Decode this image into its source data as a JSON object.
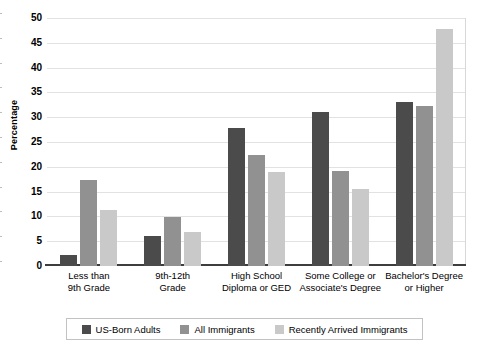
{
  "chart_data": {
    "type": "bar",
    "title": "",
    "xlabel": "",
    "ylabel": "Percentage",
    "ylim": [
      0,
      50
    ],
    "yticks": [
      0,
      5,
      10,
      15,
      20,
      25,
      30,
      35,
      40,
      45,
      50
    ],
    "grid": true,
    "legend_position": "bottom",
    "categories": [
      "Less than 9th Grade",
      "9th-12th Grade",
      "High School Diploma or GED",
      "Some College or Associate's Degree",
      "Bachelor's Degree or Higher"
    ],
    "category_label_lines": [
      [
        "Less than",
        "9th Grade"
      ],
      [
        "9th-12th",
        "Grade"
      ],
      [
        "High School",
        "Diploma or GED"
      ],
      [
        "Some College or",
        "Associate's Degree"
      ],
      [
        "Bachelor's Degree",
        "or Higher"
      ]
    ],
    "series": [
      {
        "name": "US-Born Adults",
        "color": "#4b4b4b",
        "values": [
          2.3,
          6.1,
          27.8,
          31.0,
          33.0
        ]
      },
      {
        "name": "All Immigrants",
        "color": "#919191",
        "values": [
          17.3,
          9.8,
          22.4,
          19.2,
          32.3
        ]
      },
      {
        "name": "Recently Arrived Immigrants",
        "color": "#c9c9c9",
        "values": [
          11.2,
          6.9,
          19.0,
          15.5,
          47.8
        ]
      }
    ]
  },
  "legend": {
    "items": [
      {
        "label": "US-Born Adults",
        "color": "#4b4b4b"
      },
      {
        "label": "All Immigrants",
        "color": "#919191"
      },
      {
        "label": "Recently Arrived Immigrants",
        "color": "#c9c9c9"
      }
    ]
  }
}
